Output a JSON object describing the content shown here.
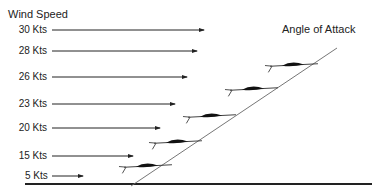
{
  "titles": {
    "wind_speed": "Wind Speed",
    "angle_of_attack": "Angle of Attack"
  },
  "wind_arrows": [
    {
      "label": "30 Kts",
      "y": 30,
      "x_end": 204
    },
    {
      "label": "28 Kts",
      "y": 51,
      "x_end": 197
    },
    {
      "label": "26 Kts",
      "y": 77,
      "x_end": 187
    },
    {
      "label": "23 Kts",
      "y": 104,
      "x_end": 175
    },
    {
      "label": "20 Kts",
      "y": 128,
      "x_end": 160
    },
    {
      "label": "15 Kts",
      "y": 156,
      "x_end": 133
    },
    {
      "label": "5 Kts",
      "y": 176,
      "x_end": 83
    }
  ],
  "aircraft": [
    {
      "cx": 148,
      "cy": 166
    },
    {
      "cx": 178,
      "cy": 142
    },
    {
      "cx": 212,
      "cy": 116
    },
    {
      "cx": 254,
      "cy": 89
    },
    {
      "cx": 294,
      "cy": 65
    }
  ],
  "colors": {
    "ink": "#222222",
    "line": "#666666"
  }
}
